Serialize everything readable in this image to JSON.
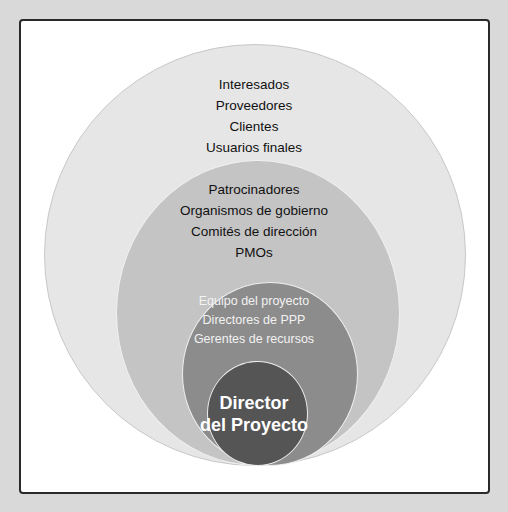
{
  "diagram": {
    "type": "nested-circles",
    "title": "",
    "layers": [
      {
        "level": 1,
        "color": "#e6e6e6",
        "items": [
          "Interesados",
          "Proveedores",
          "Clientes",
          "Usuarios finales"
        ]
      },
      {
        "level": 2,
        "color": "#c4c4c4",
        "items": [
          "Patrocinadores",
          "Organismos de gobierno",
          "Comités de dirección",
          "PMOs"
        ]
      },
      {
        "level": 3,
        "color": "#8c8c8c",
        "items": [
          "Equipo del proyecto",
          "Directores de PPP",
          "Gerentes de recursos"
        ]
      },
      {
        "level": 4,
        "color": "#555555",
        "items": [
          "Director",
          "del Proyecto"
        ]
      }
    ]
  }
}
